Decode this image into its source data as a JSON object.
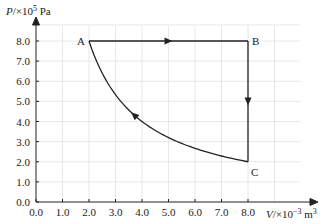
{
  "chart_data": {
    "type": "line",
    "title": "",
    "xlabel": "V/×10⁻³ m³",
    "ylabel": "P/×10⁵ Pa",
    "xlabel_parts": {
      "var": "V",
      "unit_prefix": "/×10",
      "exp": "−3",
      "unit": " m",
      "unit_exp": "3"
    },
    "ylabel_parts": {
      "var": "P",
      "unit_prefix": "/×10",
      "exp": "5",
      "unit": " Pa"
    },
    "xlim": [
      0,
      8.0
    ],
    "ylim": [
      0,
      8.0
    ],
    "x_ticks": [
      "0.0",
      "1.0",
      "2.0",
      "3.0",
      "4.0",
      "5.0",
      "6.0",
      "7.0",
      "8.0"
    ],
    "y_ticks": [
      "0.0",
      "1.0",
      "2.0",
      "3.0",
      "4.0",
      "5.0",
      "6.0",
      "7.0",
      "8.0"
    ],
    "grid": true,
    "points": [
      {
        "label": "A",
        "V": 2.0,
        "P": 8.0
      },
      {
        "label": "B",
        "V": 8.0,
        "P": 8.0
      },
      {
        "label": "C",
        "V": 8.0,
        "P": 2.0
      }
    ],
    "series": [
      {
        "name": "A→B (isobaric)",
        "from": "A",
        "to": "B",
        "x": [
          2.0,
          8.0
        ],
        "y": [
          8.0,
          8.0
        ],
        "arrow_direction": "right"
      },
      {
        "name": "B→C (isochoric)",
        "from": "B",
        "to": "C",
        "x": [
          8.0,
          8.0
        ],
        "y": [
          8.0,
          2.0
        ],
        "arrow_direction": "down"
      },
      {
        "name": "C→A (curve, PV=const)",
        "from": "C",
        "to": "A",
        "x": [
          8.0,
          7.0,
          6.0,
          5.0,
          4.0,
          3.0,
          2.0
        ],
        "y": [
          2.0,
          2.29,
          2.67,
          3.2,
          4.0,
          5.33,
          8.0
        ],
        "arrow_direction": "up-left"
      }
    ],
    "legend": null
  }
}
